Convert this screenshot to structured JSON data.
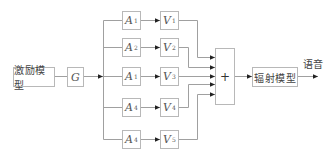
{
  "diagram": {
    "type": "block-diagram",
    "nodes": {
      "excitation": {
        "label": "激励模型"
      },
      "gain": {
        "label": "G"
      },
      "branches": [
        {
          "a_sym": "A",
          "a_sub": "1",
          "v_sym": "V",
          "v_sub": "1"
        },
        {
          "a_sym": "A",
          "a_sub": "2",
          "v_sym": "V",
          "v_sub": "2"
        },
        {
          "a_sym": "A",
          "a_sub": "1",
          "v_sym": "V",
          "v_sub": "3"
        },
        {
          "a_sym": "A",
          "a_sub": "4",
          "v_sym": "V",
          "v_sub": "4"
        },
        {
          "a_sym": "A",
          "a_sub": "4",
          "v_sym": "V",
          "v_sub": "5"
        }
      ],
      "sum": {
        "label": "+"
      },
      "radiation": {
        "label": "辐射模型"
      },
      "output": {
        "label": "语音"
      }
    },
    "colors": {
      "line": "#9a9a9a",
      "box_border": "#b8b8b8",
      "text": "#444444"
    }
  }
}
